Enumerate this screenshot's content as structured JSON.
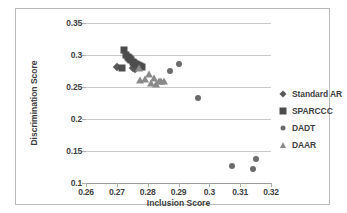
{
  "chart_data": {
    "type": "scatter",
    "title": "",
    "xlabel": "Inclusion Score",
    "ylabel": "Discrimination Score",
    "xlim": [
      0.26,
      0.32
    ],
    "ylim": [
      0.1,
      0.35
    ],
    "xticks": [
      "0.26",
      "0.27",
      "0.28",
      "0.29",
      "0.3",
      "0.31",
      "0.32"
    ],
    "yticks": [
      "0.1",
      "0.15",
      "0.2",
      "0.25",
      "0.3",
      "0.35"
    ],
    "grid": "horizontal",
    "legend_position": "right",
    "series": [
      {
        "name": "Standard AR",
        "marker": "diamond",
        "color": "#595959",
        "points": [
          [
            0.2699,
            0.2815
          ],
          [
            0.2751,
            0.2795
          ],
          [
            0.2758,
            0.2788
          ]
        ]
      },
      {
        "name": "SPARCCC",
        "marker": "square",
        "color": "#4d4d4d",
        "points": [
          [
            0.2722,
            0.3075
          ],
          [
            0.2729,
            0.3005
          ],
          [
            0.2735,
            0.2975
          ],
          [
            0.2738,
            0.2955
          ],
          [
            0.2742,
            0.2935
          ],
          [
            0.2746,
            0.2915
          ],
          [
            0.2751,
            0.2895
          ],
          [
            0.2756,
            0.2875
          ],
          [
            0.2761,
            0.2855
          ],
          [
            0.2768,
            0.2838
          ],
          [
            0.2775,
            0.2828
          ],
          [
            0.2718,
            0.28
          ],
          [
            0.278,
            0.282
          ]
        ]
      },
      {
        "name": "DADT",
        "marker": "circle",
        "color": "#6b6b6b",
        "points": [
          [
            0.2901,
            0.2855
          ],
          [
            0.2873,
            0.2752
          ],
          [
            0.2964,
            0.233
          ],
          [
            0.3074,
            0.1272
          ],
          [
            0.3143,
            0.1215
          ],
          [
            0.3151,
            0.1372
          ]
        ]
      },
      {
        "name": "DAAR",
        "marker": "triangle",
        "color": "#8a8a8a",
        "points": [
          [
            0.2772,
            0.28
          ],
          [
            0.2776,
            0.2608
          ],
          [
            0.279,
            0.2622
          ],
          [
            0.2805,
            0.27
          ],
          [
            0.2812,
            0.2568
          ],
          [
            0.282,
            0.264
          ],
          [
            0.2828,
            0.2552
          ],
          [
            0.2838,
            0.2588
          ],
          [
            0.2844,
            0.2598
          ],
          [
            0.2852,
            0.2588
          ]
        ]
      }
    ]
  },
  "legend": {
    "items": [
      {
        "label": "Standard AR",
        "marker": "diamond"
      },
      {
        "label": "SPARCCC",
        "marker": "square"
      },
      {
        "label": "DADT",
        "marker": "circle"
      },
      {
        "label": "DAAR",
        "marker": "triangle"
      }
    ]
  },
  "colors": {
    "standard_ar": "#595959",
    "sparccc": "#4d4d4d",
    "dadt": "#6b6b6b",
    "daar": "#8a8a8a",
    "gridline": "#c9c9c9",
    "border": "#b8b8b8",
    "text": "#3f3f3f"
  }
}
